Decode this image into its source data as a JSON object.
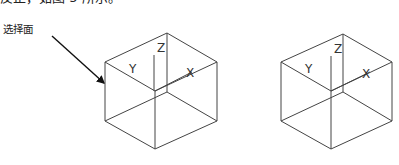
{
  "document": {
    "top_line_text": "反正，如图 5 所示。",
    "callout_label": "选择面"
  },
  "figure": {
    "left_cube": {
      "axis_labels": {
        "x": "X",
        "y": "Y",
        "z": "Z"
      },
      "selected_face": "left"
    },
    "right_cube": {
      "axis_labels": {
        "x": "X",
        "y": "Y",
        "z": "Z"
      }
    },
    "colors": {
      "line": "#444444",
      "arrow": "#111111",
      "background": "#ffffff"
    }
  }
}
